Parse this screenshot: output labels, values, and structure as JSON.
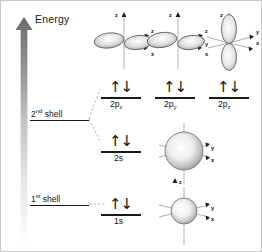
{
  "figure": {
    "background": "#ffffff",
    "border_color": "#c8c8c8",
    "width": 262,
    "height": 252
  },
  "axis": {
    "energy_label": "Energy",
    "direction": "upward",
    "arrow_color_top": "#6e6e6e",
    "arrow_color_bottom": "#ffffff"
  },
  "shells": [
    {
      "id": "shell2",
      "label_prefix": "2",
      "label_sup": "nd",
      "label_suffix": " shell",
      "text": "2nd shell"
    },
    {
      "id": "shell1",
      "label_prefix": "1",
      "label_sup": "st",
      "label_suffix": " shell",
      "text": "1st shell"
    }
  ],
  "levels": [
    {
      "id": "2px",
      "name_base": "2p",
      "name_sub": "x",
      "electrons": "↑↓",
      "electron_count": 2,
      "shell": "2nd shell"
    },
    {
      "id": "2py",
      "name_base": "2p",
      "name_sub": "y",
      "electrons": "↑↓",
      "electron_count": 2,
      "shell": "2nd shell"
    },
    {
      "id": "2pz",
      "name_base": "2p",
      "name_sub": "z",
      "electrons": "↑↓",
      "electron_count": 2,
      "shell": "2nd shell"
    },
    {
      "id": "2s",
      "name_base": "2s",
      "name_sub": "",
      "electrons": "↑↓",
      "electron_count": 2,
      "shell": "2nd shell"
    },
    {
      "id": "1s",
      "name_base": "1s",
      "name_sub": "",
      "electrons": "↑↓",
      "electron_count": 2,
      "shell": "1st shell"
    }
  ],
  "orbitals": [
    {
      "id": "2px-shape",
      "type": "p",
      "orientation": "x",
      "axes": [
        "z",
        "y",
        "x"
      ]
    },
    {
      "id": "2py-shape",
      "type": "p",
      "orientation": "y",
      "axes": [
        "z",
        "y",
        "x"
      ]
    },
    {
      "id": "2pz-shape",
      "type": "p",
      "orientation": "z",
      "axes": [
        "z",
        "y",
        "x"
      ]
    },
    {
      "id": "2s-shape",
      "type": "s",
      "orientation": "spherical",
      "axes": [
        "z",
        "y",
        "x"
      ]
    },
    {
      "id": "1s-shape",
      "type": "s",
      "orientation": "spherical",
      "axes": [
        "z",
        "y",
        "x"
      ]
    }
  ],
  "axis_tick_labels": {
    "z": "z",
    "y": "y",
    "x": "x"
  },
  "colors": {
    "line": "#1a1a1a",
    "orbital_stroke": "#555555",
    "orbital_fill_light": "#ffffff",
    "orbital_fill_dark": "#9a9a9a",
    "axis_line": "#b5b5b5",
    "connector": "#b0b0b0"
  }
}
